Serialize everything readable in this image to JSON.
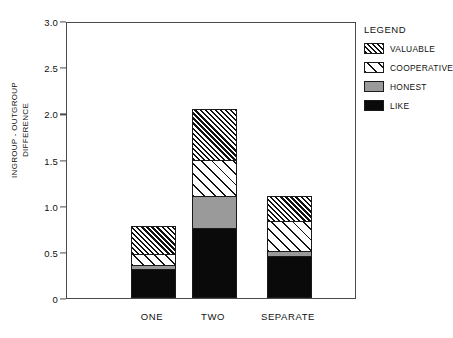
{
  "chart_data": {
    "type": "bar",
    "stacked": true,
    "title": "",
    "xlabel": "",
    "ylabel": "INGROUP - OUTGROUP DIFFERENCE",
    "ylabel_lines": [
      "INGROUP - OUTGROUP",
      "DIFFERENCE"
    ],
    "ylim": [
      0,
      3.0
    ],
    "ytick_labels": [
      "3.0",
      "2.5",
      "2.0",
      "1.5",
      "1.0",
      "0.5",
      "0"
    ],
    "ytick_values": [
      3.0,
      2.5,
      2.0,
      1.5,
      1.0,
      0.5,
      0
    ],
    "grid": false,
    "categories": [
      "ONE",
      "TWO",
      "SEPARATE"
    ],
    "series": [
      {
        "name": "LIKE",
        "values": [
          0.31,
          0.76,
          0.46
        ],
        "fill": "solid-black",
        "color": "#0a0a0a"
      },
      {
        "name": "HONEST",
        "values": [
          0.05,
          0.35,
          0.05
        ],
        "fill": "solid-gray",
        "color": "#9a9a9a"
      },
      {
        "name": "COOPERATIVE",
        "values": [
          0.12,
          0.39,
          0.32
        ],
        "fill": "hatch-sparse",
        "color": "#ffffff"
      },
      {
        "name": "VALUABLE",
        "values": [
          0.3,
          0.55,
          0.28
        ],
        "fill": "hatch-dense",
        "color": "#ffffff"
      }
    ],
    "totals": [
      0.78,
      2.05,
      1.11
    ],
    "legend": {
      "title": "LEGEND",
      "position": "right",
      "entries": [
        {
          "label": "VALUABLE",
          "fill": "hatch-dense"
        },
        {
          "label": "COOPERATIVE",
          "fill": "hatch-sparse"
        },
        {
          "label": "HONEST",
          "fill": "solid-gray"
        },
        {
          "label": "LIKE",
          "fill": "solid-black"
        }
      ]
    }
  }
}
